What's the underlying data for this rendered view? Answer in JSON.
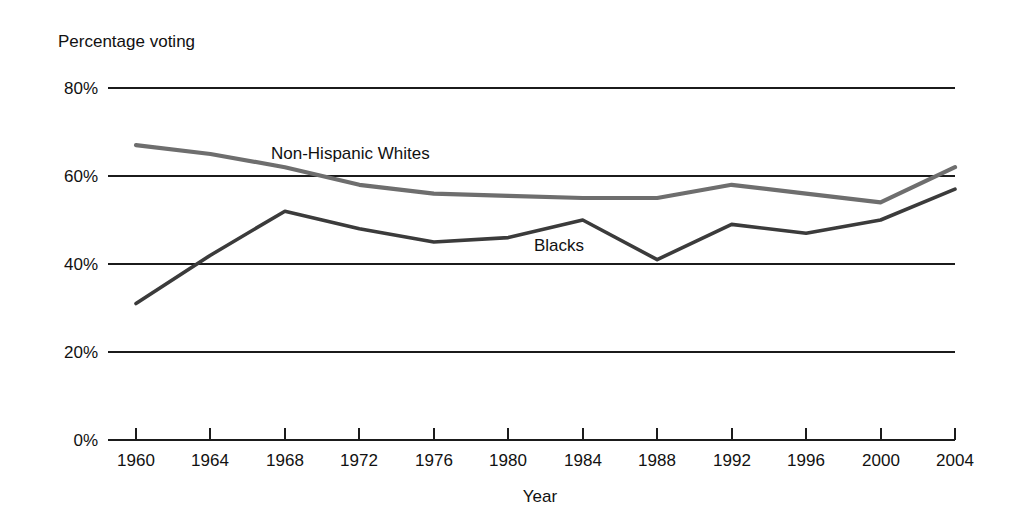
{
  "chart_data": {
    "type": "line",
    "title": "",
    "subtitle": "",
    "ylabel": "Percentage voting",
    "xlabel": "Year",
    "x": [
      1960,
      1964,
      1968,
      1972,
      1976,
      1980,
      1984,
      1988,
      1992,
      1996,
      2000,
      2004
    ],
    "categories": [
      "1960",
      "1964",
      "1968",
      "1972",
      "1976",
      "1980",
      "1984",
      "1988",
      "1992",
      "1996",
      "2000",
      "2004"
    ],
    "xlim": [
      1960,
      2004
    ],
    "ylim": [
      0,
      80
    ],
    "y_ticks": [
      0,
      20,
      40,
      60,
      80
    ],
    "y_tick_labels": [
      "0%",
      "20%",
      "40%",
      "60%",
      "80%"
    ],
    "grid": "horizontal",
    "legend_position": "inline-annotation",
    "series": [
      {
        "name": "Non-Hispanic Whites",
        "color": "#6e6e6e",
        "values": [
          67,
          65,
          62,
          58,
          56,
          55.5,
          55,
          55,
          58,
          56,
          54,
          62
        ]
      },
      {
        "name": "Blacks",
        "color": "#3b3b3b",
        "values": [
          31,
          42,
          52,
          48,
          45,
          46,
          50,
          41,
          49,
          47,
          50,
          57
        ]
      }
    ],
    "annotations": [
      {
        "text": "Non-Hispanic Whites",
        "x": 1972,
        "y": 66
      },
      {
        "text": "Blacks",
        "x": 1986,
        "y": 44
      }
    ]
  },
  "figure": {
    "background": "#ffffff",
    "axis_color": "#1b1b1b"
  }
}
